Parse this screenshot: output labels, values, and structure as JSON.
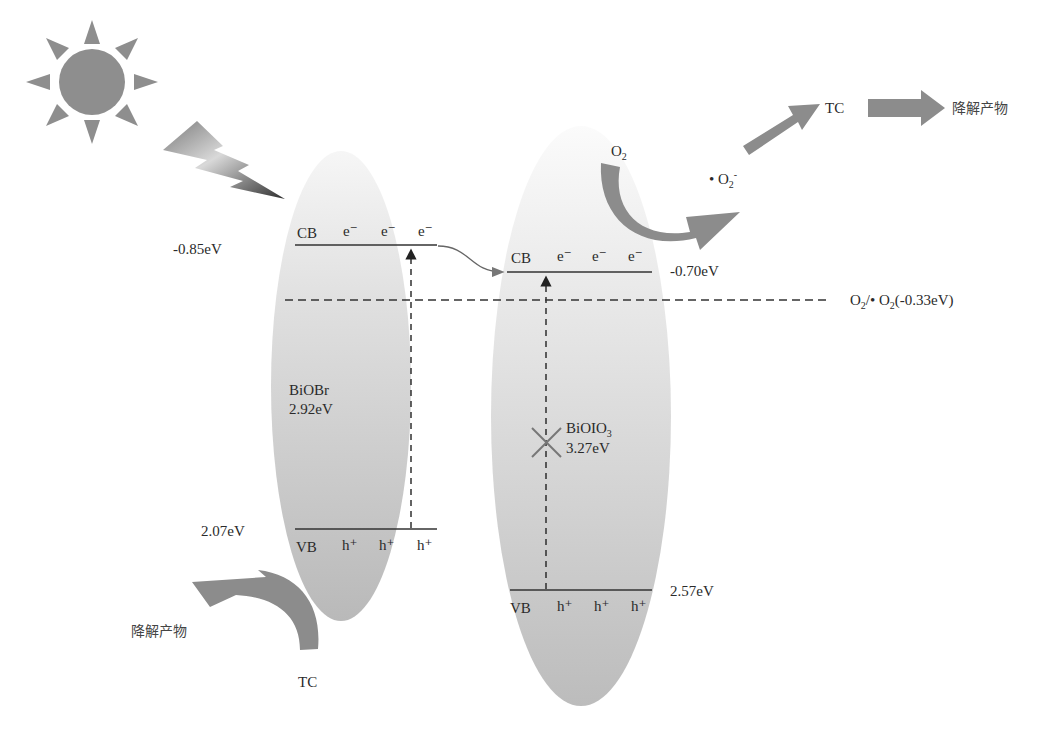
{
  "diagram": {
    "type": "band-structure-photocatalysis",
    "light_source": {
      "icon": "sun-icon",
      "ray": "lightning-icon"
    },
    "semiconductors": [
      {
        "name": "BiOBr",
        "band_gap": "2.92eV",
        "cb_label": "CB",
        "cb_potential": "-0.85eV",
        "cb_carriers": [
          "e⁻",
          "e⁻",
          "e⁻"
        ],
        "vb_label": "VB",
        "vb_potential": "2.07eV",
        "vb_carriers": [
          "h⁺",
          "h⁺",
          "h⁺"
        ]
      },
      {
        "name": "BiOIO",
        "name_sub": "3",
        "band_gap": "3.27eV",
        "cb_label": "CB",
        "cb_potential": "-0.70eV",
        "cb_carriers": [
          "e⁻",
          "e⁻",
          "e⁻"
        ],
        "vb_label": "VB",
        "vb_potential": "2.57eV",
        "vb_carriers": [
          "h⁺",
          "h⁺",
          "h⁺"
        ],
        "excitation_blocked": true
      }
    ],
    "reference_level": {
      "label_prefix": "O",
      "label_sub": "2",
      "label_mid": "/• O",
      "label_sub2": "2",
      "label_sup2": "-",
      "label_suffix": "(-0.33eV)"
    },
    "reactions": {
      "o2": {
        "base": "O",
        "sub": "2"
      },
      "superoxide": {
        "base": "• O",
        "sub": "2",
        "sup": "-"
      },
      "pollutant_top": "TC",
      "product_top": "降解产物",
      "pollutant_bottom": "TC",
      "product_bottom": "降解产物"
    },
    "colors": {
      "arrow": "#8c8c8c",
      "ellipse": "#c8c8c8",
      "sun": "#8e8e8e",
      "line": "#333333"
    }
  }
}
